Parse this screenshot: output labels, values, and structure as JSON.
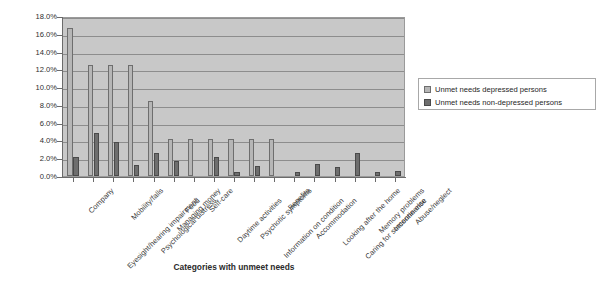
{
  "chart_data": {
    "type": "bar",
    "title": "",
    "xlabel": "Categories with unmeet needs",
    "ylabel": "Percentage",
    "ylim": [
      0,
      18
    ],
    "ytick_labels": [
      "18.0%",
      "16.0%",
      "14.0%",
      "12.0%",
      "10.0%",
      "8.0%",
      "6.0%",
      "4.0%",
      "2.0%",
      "0.0%"
    ],
    "ytick_values": [
      18,
      16,
      14,
      12,
      10,
      8,
      6,
      4,
      2,
      0
    ],
    "grid": true,
    "legend_position": "right",
    "categories": [
      "Company",
      "Eyesight/hearing impairment",
      "Mobility/falls",
      "Psychological distress",
      "Managing money",
      "Food",
      "Self-care",
      "Daytime activities",
      "Psychotic symptoms",
      "Information on condition",
      "Benefits",
      "Accommodation",
      "Looking after the home",
      "Caring for someone else",
      "Memory problems",
      "Incontinence",
      "Abuse/neglect"
    ],
    "series": [
      {
        "name": "Unmet needs depressed persons",
        "color": "#b6b6b6",
        "values": [
          16.6,
          12.5,
          12.5,
          12.5,
          8.4,
          4.2,
          4.2,
          4.2,
          4.2,
          4.2,
          4.2,
          0,
          0,
          0,
          0,
          0,
          0
        ]
      },
      {
        "name": "Unmet needs non-depressed persons",
        "color": "#6e6e6e",
        "values": [
          2.1,
          4.8,
          3.8,
          1.2,
          2.6,
          1.7,
          0,
          2.1,
          0.5,
          1.1,
          0,
          0.5,
          1.4,
          1.0,
          2.6,
          0.5,
          0.6
        ]
      }
    ]
  },
  "legend": {
    "entries": [
      {
        "label": "Unmet needs depressed persons",
        "swatch": "s1"
      },
      {
        "label": "Unmet needs non-depressed persons",
        "swatch": "s2"
      }
    ]
  },
  "caption": {
    "text": ""
  }
}
